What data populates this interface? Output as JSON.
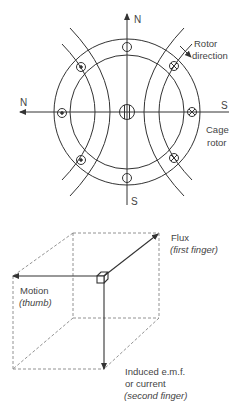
{
  "motor_diagram": {
    "axis_labels": {
      "top": "N",
      "bottom": "S",
      "left": "N",
      "right": "S"
    },
    "rotor_direction_label_1": "Rotor",
    "rotor_direction_label_2": "direction",
    "cage_rotor_label_1": "Cage",
    "cage_rotor_label_2": "rotor",
    "conductors": [
      {
        "position": "top",
        "symbol": "empty"
      },
      {
        "position": "bottom",
        "symbol": "empty"
      },
      {
        "position": "upper-left",
        "symbol": "dot"
      },
      {
        "position": "left",
        "symbol": "dot"
      },
      {
        "position": "lower-left",
        "symbol": "dot"
      },
      {
        "position": "upper-right",
        "symbol": "cross"
      },
      {
        "position": "right",
        "symbol": "cross"
      },
      {
        "position": "lower-right",
        "symbol": "cross"
      }
    ]
  },
  "hand_rule_diagram": {
    "flux_label": "Flux",
    "flux_sub": "(first finger)",
    "motion_label": "Motion",
    "motion_sub": "(thumb)",
    "emf_label_1": "Induced e.m.f.",
    "emf_label_2": "or current",
    "emf_sub": "(second finger)"
  },
  "colors": {
    "line": "#333333",
    "text": "#444444",
    "dash": "#777777"
  }
}
